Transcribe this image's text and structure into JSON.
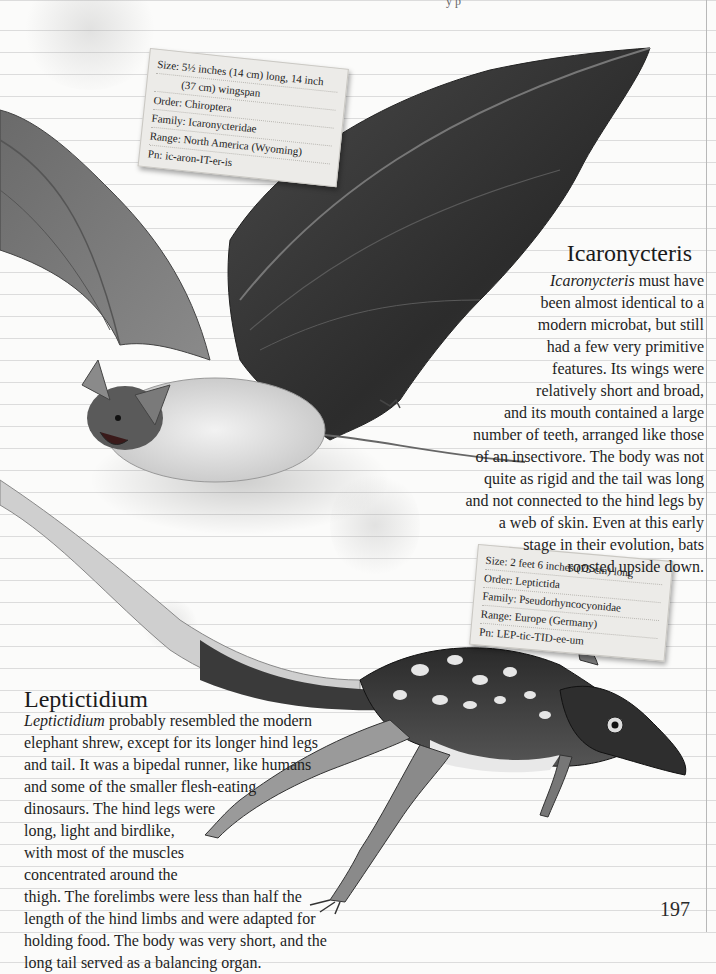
{
  "page": {
    "number": "197",
    "header_fragment": "y p"
  },
  "icaronycteris": {
    "card": {
      "size_line1": "Size: 5½ inches (14 cm) long, 14 inch",
      "size_line2": "(37 cm) wingspan",
      "order": "Order: Chiroptera",
      "family": "Family: Icaronycteridae",
      "range": "Range: North America (Wyoming)",
      "pronunciation": "Pn: ic-aron-IT-er-is"
    },
    "title": "Icaronycteris",
    "body_lead_italic": "Icaronycteris",
    "body_lines": [
      " must have",
      "been almost identical to a",
      "modern microbat, but still",
      "had a few very primitive",
      "features. Its wings were",
      "relatively short and broad,",
      "and its mouth contained a large",
      "number of teeth, arranged like those",
      "of an insectivore. The body was not",
      "quite as rigid and the tail was long",
      "and not connected to the hind legs by",
      "a web of skin. Even at this early",
      "stage in their evolution, bats",
      "roosted upside down."
    ]
  },
  "leptictidium": {
    "card": {
      "size": "Size: 2 feet 6 inches (75 cm) long",
      "order": "Order: Leptictida",
      "family": "Family: Pseudorhyncocyonidae",
      "range": "Range: Europe (Germany)",
      "pronunciation": "Pn: LEP-tic-TID-ee-um"
    },
    "title": "Leptictidium",
    "body_lead_italic": "Leptictidium",
    "body_lines": [
      " probably resembled the modern",
      "elephant shrew, except for its longer hind legs",
      "and tail. It was a bipedal runner, like humans",
      "and some of the smaller flesh-eating",
      "dinosaurs. The hind legs were",
      "long, light and birdlike,",
      "with most of the muscles",
      "concentrated around the",
      "thigh. The forelimbs were less than half the",
      "length of the hind limbs and were adapted for",
      "holding food. The body was very short, and the",
      "long tail served as a balancing organ."
    ]
  },
  "colors": {
    "paper": "#fbfbfa",
    "rule_line": "#dcdcdc",
    "card": "#ecebe8",
    "ink": "#1e1e1e"
  }
}
